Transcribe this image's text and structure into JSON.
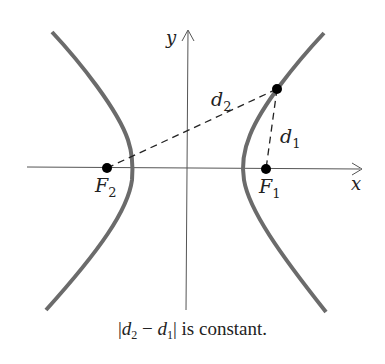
{
  "figure": {
    "axes": {
      "x_label": "x",
      "y_label": "y",
      "color": "#555555"
    },
    "foci": [
      {
        "label": "F",
        "subscript": "2",
        "name": "F2"
      },
      {
        "label": "F",
        "subscript": "1",
        "name": "F1"
      }
    ],
    "distances": [
      {
        "label": "d",
        "subscript": "2",
        "from": "F2",
        "to": "P"
      },
      {
        "label": "d",
        "subscript": "1",
        "from": "F1",
        "to": "P"
      }
    ],
    "curve_color": "#6b6b6b",
    "point_color": "#000000"
  },
  "caption": {
    "abs_open": "|",
    "d2": "d",
    "d2_sub": "2",
    "minus": " − ",
    "d1": "d",
    "d1_sub": "1",
    "abs_close": "|",
    "text": " is constant."
  }
}
